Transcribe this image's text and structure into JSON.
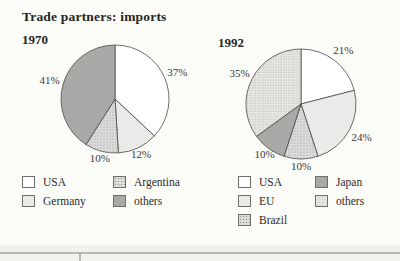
{
  "page": {
    "title": "Trade partners: imports"
  },
  "chart_data": [
    {
      "type": "pie",
      "title": "1970",
      "unit": "percent",
      "start_angle": "12-oclock, clockwise",
      "legend_position": "below, 2 columns",
      "slices": [
        {
          "label": "USA",
          "value": 37,
          "display": "37%",
          "fill": "white"
        },
        {
          "label": "Germany",
          "value": 12,
          "display": "12%",
          "fill": "light"
        },
        {
          "label": "Argentina",
          "value": 10,
          "display": "10%",
          "fill": "speckle"
        },
        {
          "label": "others",
          "value": 41,
          "display": "41%",
          "fill": "dark"
        }
      ]
    },
    {
      "type": "pie",
      "title": "1992",
      "unit": "percent",
      "start_angle": "12-oclock, clockwise",
      "legend_position": "below, 2 columns",
      "slices": [
        {
          "label": "USA",
          "value": 21,
          "display": "21%",
          "fill": "white"
        },
        {
          "label": "EU",
          "value": 24,
          "display": "24%",
          "fill": "light"
        },
        {
          "label": "Brazil",
          "value": 10,
          "display": "10%",
          "fill": "speckle"
        },
        {
          "label": "Japan",
          "value": 10,
          "display": "10%",
          "fill": "dark"
        },
        {
          "label": "others",
          "value": 35,
          "display": "35%",
          "fill": "dotgrid"
        }
      ]
    }
  ],
  "palette": {
    "white": "#ffffff",
    "light": "#eaeae8",
    "speckle_bg": "#dcdcda",
    "speckle_dot": "#8f8f8d",
    "dark": "#a9a9a7",
    "dotgrid_bg": "#e7e7e3",
    "dotgrid_dot": "#adadab",
    "outline": "#4a4a48",
    "label_text": "#3a3a38",
    "title_text": "#262624",
    "rule": "#b7b7b5",
    "background": "#fbfbf8"
  }
}
